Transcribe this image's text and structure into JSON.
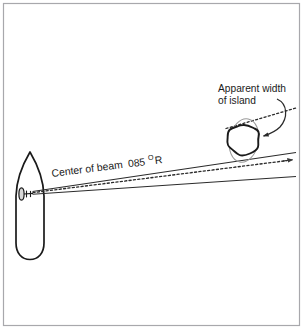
{
  "figure": {
    "kind": "navigation-radar-diagram",
    "title_visible": false,
    "background_color": "#ffffff",
    "frame_border_color": "#a8a8ac",
    "ink_color": "#1a1a1a",
    "ghost_color": "#9a9a9a"
  },
  "labels": {
    "apparent_width_line1": "Apparent width",
    "apparent_width_line2": "of island",
    "beam_prefix": "Center of beam",
    "beam_bearing": "085",
    "beam_degree": "O",
    "beam_suffix": "R"
  },
  "elements": {
    "ship": {
      "name": "ship-hull",
      "description": "own vessel, bow pointing up",
      "bow_x": 30,
      "bow_y": 152,
      "stern_y": 259,
      "beam_left_x": 16,
      "beam_right_x": 44
    },
    "radar_antenna": {
      "name": "radar-antenna",
      "x": 21,
      "y": 194
    },
    "island": {
      "name": "island-landmass",
      "center_x": 243,
      "center_y": 141,
      "radius": 16
    },
    "apparent_width_ellipse": {
      "name": "apparent-width-ellipse",
      "center_x": 244,
      "center_y": 140,
      "rx": 15,
      "ry": 22,
      "rotation_deg": 12
    },
    "beam_centerline": {
      "name": "beam-centerline",
      "style": "dotted",
      "start_x": 32,
      "start_y": 192,
      "end_x": 291,
      "end_y": 160,
      "arrowhead": true
    },
    "beam_edge_upper": {
      "name": "beam-edge-upper",
      "style": "solid",
      "start_x": 32,
      "start_y": 191,
      "end_x": 296,
      "end_y": 152
    },
    "beam_edge_lower": {
      "name": "beam-edge-lower",
      "style": "solid",
      "start_x": 32,
      "start_y": 194,
      "end_x": 296,
      "end_y": 176
    },
    "upper_dotted_ray": {
      "name": "upper-dotted-ray",
      "style": "dotted",
      "start_x": 228,
      "start_y": 127,
      "end_x": 296,
      "end_y": 108
    },
    "callout_arrow": {
      "name": "callout-curved-arrow",
      "from_x": 281,
      "from_y": 100,
      "to_x": 262,
      "to_y": 136
    }
  }
}
